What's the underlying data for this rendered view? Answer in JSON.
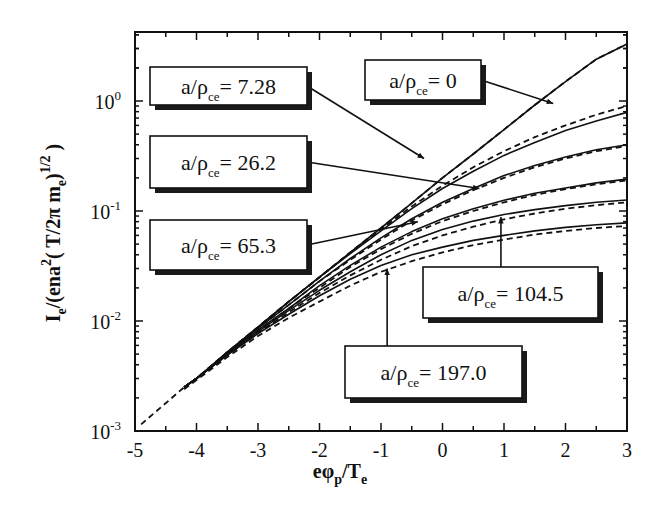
{
  "chart_data": {
    "type": "line",
    "title": "",
    "xlabel": "eφp/Te",
    "ylabel": "Ie/(ena²(T/2π me)^1/2)",
    "xlim": [
      -5,
      3
    ],
    "ylim": [
      0.001,
      4.2
    ],
    "yscale": "log",
    "grid": false,
    "x_ticks": [
      -5,
      -4,
      -3,
      -2,
      -1,
      0,
      1,
      2,
      3
    ],
    "x_tick_labels": [
      "-5",
      "-4",
      "-3",
      "-2",
      "-1",
      "0",
      "1",
      "2",
      "3"
    ],
    "y_ticks": [
      0.001,
      0.01,
      0.1,
      1
    ],
    "y_tick_labels": [
      {
        "base": "10",
        "exp": "-3"
      },
      {
        "base": "10",
        "exp": "-2"
      },
      {
        "base": "10",
        "exp": "-1"
      },
      {
        "base": "10",
        "exp": "0"
      }
    ],
    "x": [
      -4.2,
      -4,
      -3.5,
      -3,
      -2.5,
      -2,
      -1.5,
      -1,
      -0.5,
      0,
      0.5,
      1,
      1.5,
      2,
      2.5,
      3
    ],
    "series": [
      {
        "name": "a/ρce = 0",
        "style": "solid",
        "values": [
          0.0025,
          0.003,
          0.0052,
          0.0088,
          0.015,
          0.025,
          0.042,
          0.07,
          0.118,
          0.2,
          0.33,
          0.55,
          0.92,
          1.5,
          2.4,
          3.3
        ]
      },
      {
        "name": "a/ρce = 0 (model)",
        "style": "dashed",
        "values": [
          0.0025,
          0.003,
          0.0052,
          0.0088,
          0.015,
          0.025,
          0.042,
          0.07,
          0.118,
          0.2,
          0.33,
          0.55,
          0.92,
          1.5,
          2.4,
          3.3
        ]
      },
      {
        "name": "a/ρce = 7.28",
        "style": "solid",
        "values": [
          0.0025,
          0.003,
          0.0052,
          0.0088,
          0.015,
          0.025,
          0.041,
          0.066,
          0.105,
          0.16,
          0.23,
          0.32,
          0.42,
          0.54,
          0.66,
          0.79
        ]
      },
      {
        "name": "a/ρce = 7.28 (model)",
        "style": "dashed",
        "values": [
          0.0025,
          0.003,
          0.0052,
          0.0088,
          0.015,
          0.025,
          0.042,
          0.068,
          0.11,
          0.17,
          0.25,
          0.35,
          0.47,
          0.6,
          0.75,
          0.9
        ]
      },
      {
        "name": "a/ρce = 26.2",
        "style": "solid",
        "values": [
          0.0025,
          0.003,
          0.0051,
          0.0086,
          0.014,
          0.023,
          0.037,
          0.057,
          0.085,
          0.12,
          0.16,
          0.21,
          0.26,
          0.31,
          0.36,
          0.4
        ]
      },
      {
        "name": "a/ρce = 26.2 (model)",
        "style": "dashed",
        "values": [
          0.0025,
          0.003,
          0.0051,
          0.0086,
          0.014,
          0.023,
          0.036,
          0.055,
          0.082,
          0.115,
          0.155,
          0.2,
          0.25,
          0.3,
          0.35,
          0.39
        ]
      },
      {
        "name": "a/ρce = 65.3",
        "style": "solid",
        "values": [
          0.0025,
          0.003,
          0.005,
          0.0083,
          0.013,
          0.021,
          0.032,
          0.047,
          0.065,
          0.085,
          0.105,
          0.125,
          0.145,
          0.162,
          0.18,
          0.195
        ]
      },
      {
        "name": "a/ρce = 65.3 (model)",
        "style": "dashed",
        "values": [
          0.0025,
          0.003,
          0.005,
          0.0082,
          0.013,
          0.02,
          0.031,
          0.045,
          0.062,
          0.081,
          0.1,
          0.12,
          0.14,
          0.158,
          0.175,
          0.19
        ]
      },
      {
        "name": "a/ρce = 104.5",
        "style": "solid",
        "values": [
          0.0025,
          0.003,
          0.005,
          0.008,
          0.0125,
          0.019,
          0.028,
          0.04,
          0.054,
          0.068,
          0.081,
          0.093,
          0.103,
          0.112,
          0.12,
          0.126
        ]
      },
      {
        "name": "a/ρce = 104.5 (model)",
        "style": "dashed",
        "values": [
          0.0025,
          0.003,
          0.0049,
          0.0078,
          0.012,
          0.018,
          0.026,
          0.036,
          0.048,
          0.06,
          0.072,
          0.084,
          0.095,
          0.105,
          0.113,
          0.12
        ]
      },
      {
        "name": "a/ρce = 197.0",
        "style": "solid",
        "values": [
          0.0025,
          0.003,
          0.0049,
          0.0077,
          0.0115,
          0.017,
          0.024,
          0.032,
          0.04,
          0.047,
          0.054,
          0.06,
          0.066,
          0.071,
          0.075,
          0.078
        ]
      },
      {
        "name": "a/ρce = 197.0 (model)",
        "style": "dashed",
        "values": [
          0.0024,
          0.0029,
          0.0047,
          0.0073,
          0.0107,
          0.015,
          0.021,
          0.028,
          0.035,
          0.042,
          0.049,
          0.055,
          0.061,
          0.066,
          0.07,
          0.073
        ]
      }
    ],
    "dashed_extension": {
      "name": "a/ρce = 0 (model, low end)",
      "x": [
        -4.9,
        -4.2
      ],
      "values": [
        0.00115,
        0.0025
      ]
    },
    "annotations": [
      {
        "label": "a/ρce = 7.28",
        "prefix": "a/ρ",
        "sub": "ce",
        "value": "= 7.28",
        "box": [
          150,
          67,
          157,
          38
        ],
        "arrow_to": [
          -0.3,
          0.3
        ]
      },
      {
        "label": "a/ρce = 0",
        "prefix": "a/ρ",
        "sub": "ce",
        "value": "= 0",
        "box": [
          365,
          60,
          116,
          40
        ],
        "arrow_to": [
          1.8,
          0.95
        ]
      },
      {
        "label": "a/ρce = 26.2",
        "prefix": "a/ρ",
        "sub": "ce",
        "value": "= 26.2",
        "box": [
          150,
          136,
          157,
          52
        ],
        "arrow_to": [
          0.6,
          0.16
        ]
      },
      {
        "label": "a/ρce = 65.3",
        "prefix": "a/ρ",
        "sub": "ce",
        "value": "= 65.3",
        "box": [
          150,
          220,
          157,
          50
        ],
        "arrow_to": [
          -0.4,
          0.08
        ]
      },
      {
        "label": "a/ρce = 104.5",
        "prefix": "a/ρ",
        "sub": "ce",
        "value": "= 104.5",
        "box": [
          423,
          267,
          175,
          51
        ],
        "arrow_to": [
          0.95,
          0.088
        ]
      },
      {
        "label": "a/ρce = 197.0",
        "prefix": "a/ρ",
        "sub": "ce",
        "value": "= 197.0",
        "box": [
          345,
          346,
          177,
          52
        ],
        "arrow_to": [
          -0.9,
          0.03
        ]
      }
    ]
  },
  "axes": {
    "xlabel_main": "eφ",
    "xlabel_sub1": "p",
    "xlabel_mid": "/T",
    "xlabel_sub2": "e",
    "ylabel_text": "I",
    "ylabel_sub": "e",
    "ylabel_rest": "/(ena",
    "ylabel_sup": "2",
    "ylabel_rest2": "( T/2π m",
    "ylabel_sub2": "e",
    "ylabel_close": ")",
    "ylabel_sup2": "1/2",
    "ylabel_end": " )"
  },
  "colors": {
    "ink": "#111111",
    "shadow": "#1a1a1a",
    "background": "#ffffff"
  }
}
